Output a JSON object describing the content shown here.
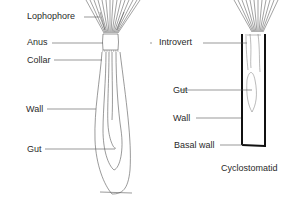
{
  "diagram": {
    "left_figure": {
      "name": "ctenostome-zooid",
      "labels": [
        {
          "key": "lophophore",
          "text": "Lophophore"
        },
        {
          "key": "anus",
          "text": "Anus"
        },
        {
          "key": "collar",
          "text": "Collar"
        },
        {
          "key": "wall",
          "text": "Wall"
        },
        {
          "key": "gut",
          "text": "Gut"
        }
      ]
    },
    "right_figure": {
      "name": "cyclostomatid-zooid",
      "caption": "Cyclostomatid",
      "labels": [
        {
          "key": "introvert",
          "text": "Introvert"
        },
        {
          "key": "gut",
          "text": "Gut"
        },
        {
          "key": "wall",
          "text": "Wall"
        },
        {
          "key": "basal_wall",
          "text": "Basal wall"
        }
      ]
    },
    "colors": {
      "line": "#555555",
      "thick_wall": "#111111",
      "text": "#2a2a2a"
    }
  }
}
